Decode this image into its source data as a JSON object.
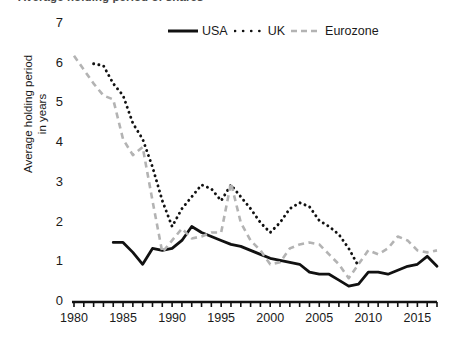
{
  "title": "Average holding period of shares",
  "legend": {
    "position": "top-center",
    "items": [
      {
        "label": "USA",
        "style": "solid",
        "color": "#111111",
        "icon": "solid-line-icon"
      },
      {
        "label": "UK",
        "style": "dotted",
        "color": "#111111",
        "icon": "dotted-line-icon"
      },
      {
        "label": "Eurozone",
        "style": "dashed",
        "color": "#b3b3b3",
        "icon": "dashed-line-icon"
      }
    ]
  },
  "axes": {
    "y_label_line1": "Average holding period",
    "y_label_line2": "in years",
    "y_ticks": [
      "0",
      "1",
      "2",
      "3",
      "4",
      "5",
      "6",
      "7"
    ],
    "x_ticks": [
      "1980",
      "1985",
      "1990",
      "1995",
      "2000",
      "2005",
      "2010",
      "2015"
    ]
  },
  "chart_data": {
    "type": "line",
    "title": "Average holding period of shares",
    "xlabel": "",
    "ylabel": "Average holding period in years",
    "xlim": [
      1980,
      2017
    ],
    "ylim": [
      0,
      7
    ],
    "grid": false,
    "legend_position": "top-center",
    "x_tick_values": [
      1980,
      1985,
      1990,
      1995,
      2000,
      2005,
      2010,
      2015
    ],
    "y_tick_values": [
      0,
      1,
      2,
      3,
      4,
      5,
      6,
      7
    ],
    "minor_x_ticks": "annual",
    "series": [
      {
        "name": "USA",
        "style": "solid",
        "color": "#111111",
        "x": [
          1984,
          1985,
          1986,
          1987,
          1988,
          1989,
          1990,
          1991,
          1992,
          1993,
          1994,
          1995,
          1996,
          1997,
          1998,
          1999,
          2000,
          2001,
          2002,
          2003,
          2004,
          2005,
          2006,
          2007,
          2008,
          2009,
          2010,
          2011,
          2012,
          2013,
          2014,
          2015,
          2016,
          2017
        ],
        "values": [
          1.5,
          1.5,
          1.25,
          0.95,
          1.35,
          1.3,
          1.35,
          1.55,
          1.9,
          1.75,
          1.65,
          1.55,
          1.45,
          1.4,
          1.3,
          1.2,
          1.1,
          1.05,
          1.0,
          0.95,
          0.75,
          0.7,
          0.7,
          0.55,
          0.4,
          0.45,
          0.75,
          0.75,
          0.7,
          0.8,
          0.9,
          0.95,
          1.15,
          0.9
        ]
      },
      {
        "name": "UK",
        "style": "dotted",
        "color": "#111111",
        "x": [
          1982,
          1983,
          1984,
          1985,
          1986,
          1987,
          1988,
          1989,
          1990,
          1991,
          1992,
          1993,
          1994,
          1995,
          1996,
          1997,
          1998,
          1999,
          2000,
          2001,
          2002,
          2003,
          2004,
          2005,
          2006,
          2007,
          2008,
          2009
        ],
        "values": [
          6.0,
          5.95,
          5.5,
          5.2,
          4.5,
          4.1,
          3.4,
          2.55,
          1.9,
          2.35,
          2.65,
          2.95,
          2.85,
          2.55,
          2.95,
          2.65,
          2.35,
          2.0,
          1.75,
          2.0,
          2.35,
          2.5,
          2.4,
          2.05,
          1.9,
          1.7,
          1.35,
          0.9
        ]
      },
      {
        "name": "Eurozone",
        "style": "dashed",
        "color": "#b3b3b3",
        "x": [
          1980,
          1981,
          1982,
          1983,
          1984,
          1985,
          1986,
          1987,
          1988,
          1989,
          1990,
          1991,
          1992,
          1993,
          1994,
          1995,
          1996,
          1997,
          1998,
          1999,
          2000,
          2001,
          2002,
          2003,
          2004,
          2005,
          2006,
          2007,
          2008,
          2009,
          2010,
          2011,
          2012,
          2013,
          2014,
          2015,
          2016,
          2017
        ],
        "values": [
          6.2,
          5.85,
          5.5,
          5.2,
          5.1,
          4.1,
          3.7,
          3.9,
          2.55,
          1.25,
          1.55,
          1.85,
          1.6,
          1.65,
          1.75,
          1.75,
          3.0,
          2.0,
          1.55,
          1.3,
          0.95,
          1.0,
          1.35,
          1.45,
          1.5,
          1.45,
          1.2,
          0.95,
          0.6,
          0.95,
          1.3,
          1.2,
          1.35,
          1.65,
          1.55,
          1.3,
          1.25,
          1.3
        ]
      }
    ]
  }
}
